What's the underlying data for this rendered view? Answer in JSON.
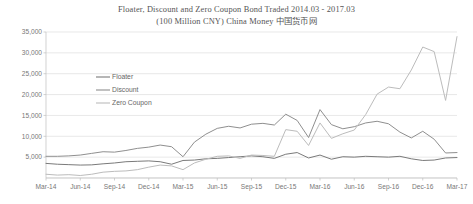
{
  "chart_data": {
    "type": "line",
    "title": "Floater, Discount and Zero Coupon Bond Traded 2014.03 - 2017.03",
    "subtitle": "(100 Million CNY) China Money 中国货币网",
    "xlabel": "",
    "ylabel": "",
    "ylim": [
      0,
      35000
    ],
    "ytick_values": [
      0,
      5000,
      10000,
      15000,
      20000,
      25000,
      30000,
      35000
    ],
    "ytick_labels": [
      "",
      "5,000",
      "10,000",
      "15,000",
      "20,000",
      "25,000",
      "30,000",
      "35,000"
    ],
    "grid": true,
    "legend_position": "upper-left-inside",
    "x": [
      "Mar-14",
      "Apr-14",
      "May-14",
      "Jun-14",
      "Jul-14",
      "Aug-14",
      "Sep-14",
      "Oct-14",
      "Nov-14",
      "Dec-14",
      "Jan-15",
      "Feb-15",
      "Mar-15",
      "Apr-15",
      "May-15",
      "Jun-15",
      "Jul-15",
      "Aug-15",
      "Sep-15",
      "Oct-15",
      "Nov-15",
      "Dec-15",
      "Jan-16",
      "Feb-16",
      "Mar-16",
      "Apr-16",
      "May-16",
      "Jun-16",
      "Jul-16",
      "Aug-16",
      "Sep-16",
      "Oct-16",
      "Nov-16",
      "Dec-16",
      "Jan-17",
      "Feb-17",
      "Mar-17"
    ],
    "xtick_labels": [
      "Mar-14",
      "Jun-14",
      "Sep-14",
      "Dec-14",
      "Mar-15",
      "Jun-15",
      "Sep-15",
      "Dec-15",
      "Mar-16",
      "Jun-16",
      "Sep-16",
      "Dec-16",
      "Mar-17"
    ],
    "xtick_indices": [
      0,
      3,
      6,
      9,
      12,
      15,
      18,
      21,
      24,
      27,
      30,
      33,
      36
    ],
    "series": [
      {
        "name": "Floater",
        "color": "#7a7a7a",
        "values": [
          3500,
          3300,
          3200,
          3100,
          3150,
          3400,
          3600,
          3900,
          4000,
          4100,
          3900,
          3300,
          4200,
          4300,
          4600,
          4700,
          4900,
          5100,
          5300,
          5100,
          4700,
          5700,
          6100,
          4800,
          5500,
          4500,
          5100,
          5000,
          5200,
          5100,
          5000,
          5200,
          4600,
          4200,
          4300,
          4800,
          4900
        ]
      },
      {
        "name": "Discount",
        "color": "#8f8f8f",
        "values": [
          5200,
          5200,
          5300,
          5500,
          5900,
          6300,
          6200,
          6600,
          7100,
          7400,
          7900,
          7500,
          5100,
          8600,
          10500,
          11900,
          12400,
          12000,
          12900,
          13100,
          12700,
          15300,
          13800,
          9700,
          16400,
          12800,
          11800,
          12300,
          13200,
          13600,
          13000,
          11000,
          9600,
          11200,
          9300,
          6000,
          6100
        ]
      },
      {
        "name": "Zero Coupon",
        "color": "#bcbcbc",
        "values": [
          900,
          700,
          800,
          600,
          900,
          1400,
          1600,
          1700,
          2000,
          2600,
          3100,
          2900,
          2000,
          3600,
          4500,
          5200,
          5300,
          4700,
          5500,
          5400,
          5200,
          11600,
          11200,
          7800,
          13200,
          9500,
          10600,
          11500,
          15200,
          20100,
          21800,
          21400,
          25900,
          31400,
          30300,
          18600,
          33900
        ]
      }
    ]
  }
}
